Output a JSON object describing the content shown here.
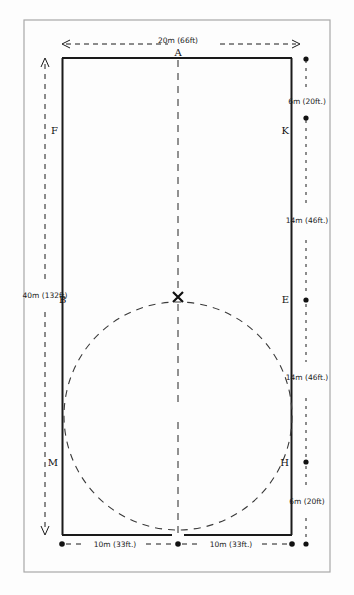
{
  "sheet": {
    "background_color": "#fdfdfd",
    "border_color": "#9a9a9a",
    "ink_color": "#1a1a1a"
  },
  "diagram": {
    "title": "",
    "type": "hand-drawn-field-layout",
    "dimensions": {
      "top_width": "20m (66ft)",
      "left_height": "40m (132ft)",
      "right_top_segment": "6m (20ft.)",
      "right_upper_mid_segment": "14m (46ft.)",
      "right_lower_mid_segment": "14m (46ft.)",
      "right_bottom_segment": "6m (20ft)",
      "bottom_left_half": "10m (33ft.)",
      "bottom_right_half": "10m (33ft.)"
    },
    "points": [
      {
        "id": "A",
        "label": "A",
        "x": 178,
        "y": 58
      },
      {
        "id": "F",
        "label": "F",
        "x": 62,
        "y": 131
      },
      {
        "id": "K",
        "label": "K",
        "x": 292,
        "y": 131
      },
      {
        "id": "B",
        "label": "B",
        "x": 62,
        "y": 299
      },
      {
        "id": "E",
        "label": "E",
        "x": 292,
        "y": 299
      },
      {
        "id": "M",
        "label": "M",
        "x": 62,
        "y": 462
      },
      {
        "id": "H",
        "label": "H",
        "x": 292,
        "y": 462
      },
      {
        "id": "X",
        "label": "X",
        "x": 178,
        "y": 297
      }
    ],
    "center_mark": "X",
    "circle": {
      "cx": 178,
      "cy": 416,
      "r": 114,
      "style": "dashed"
    }
  }
}
